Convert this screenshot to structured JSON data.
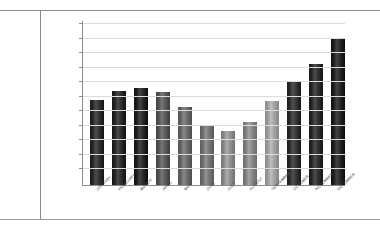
{
  "page": {
    "background_color": "#ffffff",
    "rule_color": "#8e8e8e",
    "divider_color": "#8a8a8a"
  },
  "chart_data": {
    "type": "bar",
    "title": "",
    "subtitle": "",
    "xlabel": "",
    "ylabel": "",
    "legend": [],
    "legend_position": "none",
    "grid": true,
    "gridlines": 11,
    "axis_color": "#8d8d8d",
    "gridline_color": "#dcdcdc",
    "ylim": [
      0,
      11
    ],
    "categories": [
      "JANUARY",
      "FEBRUARY",
      "MARCH",
      "APRIL",
      "MAY",
      "JUNE",
      "JULY",
      "AUGUST",
      "SEPTEMBER",
      "OCTOBER",
      "NOVEMBER",
      "DECEMBER"
    ],
    "values": [
      5.8,
      6.4,
      6.6,
      6.3,
      5.3,
      4.1,
      3.7,
      4.3,
      5.7,
      7.0,
      8.2,
      10.0
    ],
    "bar_colors": [
      "#2b2b2b",
      "#272727",
      "#232323",
      "#555555",
      "#666666",
      "#707070",
      "#8a8a8a",
      "#828282",
      "#9d9d9d",
      "#2f2f2f",
      "#2a2a2a",
      "#222222"
    ]
  }
}
